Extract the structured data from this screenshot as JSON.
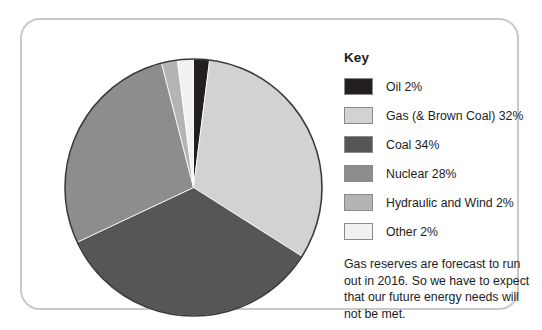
{
  "card": {
    "border_color": "#c9c9c9",
    "background": "#ffffff"
  },
  "legend": {
    "title": "Key",
    "items": [
      {
        "label": "Oil 2%",
        "color": "#231f20",
        "name": "Oil",
        "value": 2
      },
      {
        "label": "Gas (& Brown Coal) 32%",
        "color": "#d2d2d2",
        "name": "Gas (& Brown Coal)",
        "value": 32
      },
      {
        "label": "Coal 34%",
        "color": "#565656",
        "name": "Coal",
        "value": 34
      },
      {
        "label": "Nuclear 28%",
        "color": "#8d8d8d",
        "name": "Nuclear",
        "value": 28
      },
      {
        "label": "Hydraulic and Wind 2%",
        "color": "#b4b4b4",
        "name": "Hydraulic and Wind",
        "value": 2
      },
      {
        "label": "Other 2%",
        "color": "#f1f1f1",
        "name": "Other",
        "value": 2
      }
    ]
  },
  "note": {
    "text": "Gas reserves are forecast to run out in 2016. So we have to expect that our future energy needs will not be met."
  },
  "chart_data": {
    "type": "pie",
    "title": "",
    "units": "percent",
    "total": 100,
    "start_angle_deg": 0,
    "direction": "clockwise",
    "legend_position": "right",
    "legend_title": "Key",
    "categories": [
      "Oil",
      "Gas (& Brown Coal)",
      "Coal",
      "Nuclear",
      "Hydraulic and Wind",
      "Other"
    ],
    "values": [
      2,
      32,
      34,
      28,
      2,
      2
    ],
    "labels": [
      "Oil 2%",
      "Gas (& Brown Coal) 32%",
      "Coal 34%",
      "Nuclear 28%",
      "Hydraulic and Wind 2%",
      "Other 2%"
    ],
    "colors": [
      "#231f20",
      "#d2d2d2",
      "#565656",
      "#8d8d8d",
      "#b4b4b4",
      "#f1f1f1"
    ],
    "annotation": "Gas reserves are forecast to run out in 2016. So we have to expect that our future energy needs will not be met."
  }
}
